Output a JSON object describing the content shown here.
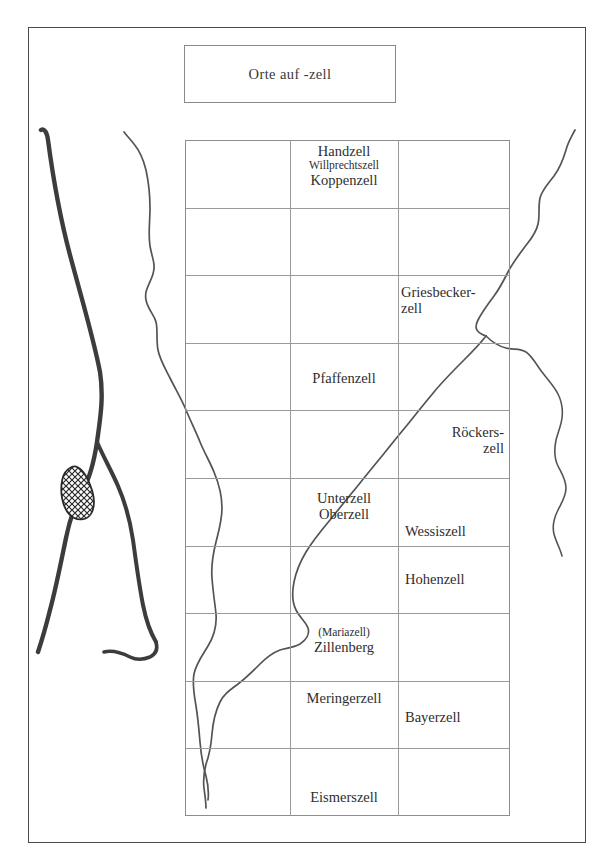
{
  "document": {
    "kind": "historical-map-figure",
    "title_box": {
      "label": "Orte auf -zell"
    }
  },
  "map": {
    "grid": {
      "columns": 3,
      "rows": 10,
      "column_boundaries_px": [
        185,
        290,
        398,
        510
      ],
      "row_height_px": 67.6,
      "line_color": "#9a9a9a"
    },
    "features": {
      "river_main_west": "thick-river-west",
      "river_west_tributary": "thin-river-west-inner",
      "river_central_diagonal": "thin-river-central",
      "river_east": "thin-river-east",
      "river_east_branch": "thin-river-east-branch",
      "town_symbol": "hatched-teardrop-settlement"
    },
    "colors": {
      "river_thick": "#3c3c3c",
      "river_thin": "#545454",
      "frame": "#4a4a4a",
      "grid": "#9a9a9a",
      "text": "#2e2e2e"
    },
    "places": [
      {
        "id": "handzell",
        "names": [
          "Handzell"
        ],
        "emphasis": [
          "normal"
        ]
      },
      {
        "id": "willprechtszell",
        "names": [
          "Willprechtszell"
        ],
        "emphasis": [
          "small"
        ]
      },
      {
        "id": "koppenzell",
        "names": [
          "Koppenzell"
        ],
        "emphasis": [
          "normal"
        ]
      },
      {
        "id": "griesbeckerzell",
        "names": [
          "Griesbecker-",
          "zell"
        ],
        "emphasis": [
          "normal",
          "normal"
        ]
      },
      {
        "id": "pfaffenzell",
        "names": [
          "Pfaffenzell"
        ],
        "emphasis": [
          "normal"
        ]
      },
      {
        "id": "roeckerszell",
        "names": [
          "Röckers-",
          "zell"
        ],
        "emphasis": [
          "normal",
          "normal"
        ]
      },
      {
        "id": "unterzell",
        "names": [
          "Unterzell"
        ],
        "emphasis": [
          "normal"
        ]
      },
      {
        "id": "oberzell",
        "names": [
          "Oberzell"
        ],
        "emphasis": [
          "normal"
        ]
      },
      {
        "id": "wessiszell",
        "names": [
          "Wessiszell"
        ],
        "emphasis": [
          "normal"
        ]
      },
      {
        "id": "hohenzell",
        "names": [
          "Hohenzell"
        ],
        "emphasis": [
          "normal"
        ]
      },
      {
        "id": "mariazell",
        "names": [
          "(Mariazell)"
        ],
        "emphasis": [
          "small"
        ]
      },
      {
        "id": "zillenberg",
        "names": [
          "Zillenberg"
        ],
        "emphasis": [
          "normal"
        ]
      },
      {
        "id": "meringerzell",
        "names": [
          "Meringerzell"
        ],
        "emphasis": [
          "normal"
        ]
      },
      {
        "id": "bayerzell",
        "names": [
          "Bayerzell"
        ],
        "emphasis": [
          "normal"
        ]
      },
      {
        "id": "eismerszell",
        "names": [
          "Eismerszell"
        ],
        "emphasis": [
          "normal"
        ]
      }
    ],
    "labels": {
      "handzell": "Handzell",
      "willprechtszell": "Willprechtszell",
      "koppenzell": "Koppenzell",
      "griesbeckerzell_line1": "Griesbecker-",
      "griesbeckerzell_line2": "zell",
      "pfaffenzell": "Pfaffenzell",
      "roeckerszell_line1": "Röckers-",
      "roeckerszell_line2": "zell",
      "unterzell": "Unterzell",
      "oberzell": "Oberzell",
      "wessiszell": "Wessiszell",
      "hohenzell": "Hohenzell",
      "mariazell": "(Mariazell)",
      "zillenberg": "Zillenberg",
      "meringerzell": "Meringerzell",
      "bayerzell": "Bayerzell",
      "eismerszell": "Eismerszell"
    }
  }
}
